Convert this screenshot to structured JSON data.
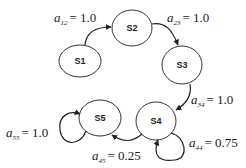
{
  "diagram": {
    "type": "markov-chain",
    "states": [
      {
        "id": "S1",
        "label": "S1",
        "cx": 80,
        "cy": 61
      },
      {
        "id": "S2",
        "label": "S2",
        "cx": 132,
        "cy": 28
      },
      {
        "id": "S3",
        "label": "S3",
        "cx": 182,
        "cy": 65
      },
      {
        "id": "S4",
        "label": "S4",
        "cx": 156,
        "cy": 121
      },
      {
        "id": "S5",
        "label": "S5",
        "cx": 100,
        "cy": 118
      }
    ],
    "transitions": [
      {
        "from": "S1",
        "to": "S2",
        "var": "a",
        "sub": "12",
        "value": "= 1.0"
      },
      {
        "from": "S2",
        "to": "S3",
        "var": "a",
        "sub": "23",
        "value": "= 1.0"
      },
      {
        "from": "S3",
        "to": "S4",
        "var": "a",
        "sub": "34",
        "value": "= 1.0"
      },
      {
        "from": "S4",
        "to": "S4",
        "var": "a",
        "sub": "44",
        "value": "= 0.75"
      },
      {
        "from": "S4",
        "to": "S5",
        "var": "a",
        "sub": "45",
        "value": "= 0.25"
      },
      {
        "from": "S5",
        "to": "S5",
        "var": "a",
        "sub": "55",
        "value": "= 1.0"
      }
    ],
    "colors": {
      "stroke": "#333333",
      "text": "#1a1a1a",
      "background": "#ffffff"
    }
  }
}
